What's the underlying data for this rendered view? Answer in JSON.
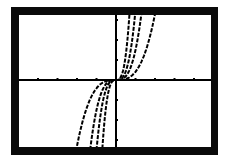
{
  "calculator_screen": {
    "frame_color": "#0a0a0a",
    "screen_color": "#ffffff",
    "plot_color": "#000000"
  },
  "chart_data": {
    "type": "line",
    "title": "",
    "xlabel": "",
    "ylabel": "",
    "grid": false,
    "legend": "none",
    "xlim": [
      -4,
      4
    ],
    "ylim": [
      -3,
      3
    ],
    "x_ticks": [
      -4,
      -3,
      -2,
      -1,
      1,
      2,
      3,
      4
    ],
    "y_ticks": [
      -3,
      -2,
      -1,
      1,
      2,
      3
    ],
    "series": [
      {
        "name": "curve-1",
        "a": 3.3
      },
      {
        "name": "curve-2",
        "a": 12
      },
      {
        "name": "curve-3",
        "a": 28
      },
      {
        "name": "curve-4",
        "a": 80
      }
    ]
  }
}
